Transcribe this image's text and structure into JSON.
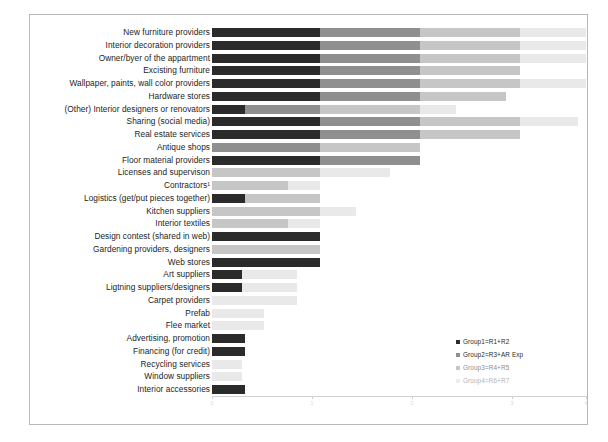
{
  "chart_data": {
    "type": "bar",
    "orientation": "horizontal",
    "stacked": true,
    "title": "",
    "xlabel": "",
    "ylabel": "",
    "grid": false,
    "legend_position": "bottom-right",
    "xlim": [
      0,
      40
    ],
    "xticks": [
      "0",
      "10",
      "20",
      "30",
      "40"
    ],
    "series": [
      {
        "name": "Group1=R1+R2",
        "color": "#2b2b2b",
        "values": [
          16,
          16,
          16,
          16,
          16,
          16,
          5,
          16,
          16,
          0,
          16,
          0,
          0,
          5,
          0,
          0,
          16,
          0,
          16,
          4,
          4,
          0,
          0,
          0,
          5,
          5,
          0,
          0,
          5
        ]
      },
      {
        "name": "Group2=R3+AR Exp",
        "color": "#8f8f8f",
        "values": [
          16,
          16,
          16,
          16,
          16,
          16,
          27,
          16,
          16,
          16,
          16,
          0,
          0,
          11,
          16,
          11,
          0,
          0,
          0,
          0,
          0,
          0,
          0,
          0,
          0,
          0,
          0,
          0,
          0
        ]
      },
      {
        "name": "Group3=R4+R5",
        "color": "#c6c6c6",
        "values": [
          16,
          16,
          16,
          15,
          16,
          11,
          11,
          0,
          0,
          0,
          0,
          16,
          11,
          0,
          0,
          0,
          0,
          16,
          0,
          0,
          0,
          11,
          8,
          8,
          0,
          0,
          5,
          5,
          0
        ]
      },
      {
        "name": "Group4=R6+R7",
        "color": "#e9e9e9",
        "values": [
          13,
          16,
          16,
          0,
          5,
          0,
          0,
          0,
          0,
          0,
          0,
          11,
          5,
          0,
          0,
          5,
          0,
          0,
          0,
          8,
          8,
          0,
          0,
          0,
          0,
          0,
          0,
          0,
          0
        ]
      }
    ],
    "categories": [
      "New furniture providers",
      "Interior decoration providers",
      "Owner/byer of the appartment",
      "Excisting furniture",
      "Wallpaper, paints, wall color providers",
      "Hardware stores",
      "(Other) Interior designers or renovators",
      "Sharing (social media)",
      "Real estate services",
      "Antique shops",
      "Floor material providers",
      "Licenses and supervison",
      "Contractors¹",
      "Logistics (get/put pieces together)",
      "Kitchen suppliers",
      "Interior textiles",
      "Design contest (shared in web)",
      "Gardening providers, designers",
      "Web stores",
      "Art suppliers",
      "Ligtning suppliers/designers",
      "Carpet providers",
      "Prefab",
      "Flee market",
      "Advertising, promotion",
      "Financing (for credit)",
      "Recycling services",
      "Window suppliers",
      "Interior accessories"
    ],
    "rows": [
      {
        "label": "New furniture providers",
        "segments": [
          {
            "w": 108,
            "c": "s0"
          },
          {
            "w": 100,
            "c": "s1"
          },
          {
            "w": 100,
            "c": "s2"
          },
          {
            "w": 66,
            "c": "s3"
          }
        ]
      },
      {
        "label": "Interior decoration providers",
        "segments": [
          {
            "w": 108,
            "c": "s0"
          },
          {
            "w": 100,
            "c": "s1"
          },
          {
            "w": 100,
            "c": "s2"
          },
          {
            "w": 66,
            "c": "s3"
          }
        ]
      },
      {
        "label": "Owner/byer of the appartment",
        "segments": [
          {
            "w": 108,
            "c": "s0"
          },
          {
            "w": 100,
            "c": "s1"
          },
          {
            "w": 100,
            "c": "s2"
          },
          {
            "w": 66,
            "c": "s3"
          }
        ]
      },
      {
        "label": "Excisting furniture",
        "segments": [
          {
            "w": 108,
            "c": "s0"
          },
          {
            "w": 100,
            "c": "s1"
          },
          {
            "w": 100,
            "c": "s2"
          },
          {
            "w": 0,
            "c": "s3"
          }
        ]
      },
      {
        "label": "Wallpaper, paints, wall color providers",
        "segments": [
          {
            "w": 108,
            "c": "s0"
          },
          {
            "w": 100,
            "c": "s1"
          },
          {
            "w": 100,
            "c": "s2"
          },
          {
            "w": 66,
            "c": "s3"
          }
        ]
      },
      {
        "label": "Hardware stores",
        "segments": [
          {
            "w": 108,
            "c": "s0"
          },
          {
            "w": 100,
            "c": "s1"
          },
          {
            "w": 86,
            "c": "s2"
          },
          {
            "w": 0,
            "c": "s3"
          }
        ]
      },
      {
        "label": "(Other) Interior designers or renovators",
        "segments": [
          {
            "w": 33,
            "c": "s0"
          },
          {
            "w": 75,
            "c": "s1"
          },
          {
            "w": 100,
            "c": "s2"
          },
          {
            "w": 36,
            "c": "s3"
          }
        ]
      },
      {
        "label": "Sharing (social media)",
        "segments": [
          {
            "w": 108,
            "c": "s0"
          },
          {
            "w": 100,
            "c": "s1"
          },
          {
            "w": 100,
            "c": "s2"
          },
          {
            "w": 58,
            "c": "s3"
          }
        ]
      },
      {
        "label": "Real estate services",
        "segments": [
          {
            "w": 108,
            "c": "s0"
          },
          {
            "w": 100,
            "c": "s1"
          },
          {
            "w": 100,
            "c": "s2"
          },
          {
            "w": 0,
            "c": "s3"
          }
        ]
      },
      {
        "label": "Antique shops",
        "segments": [
          {
            "w": 0,
            "c": "s0"
          },
          {
            "w": 108,
            "c": "s1"
          },
          {
            "w": 100,
            "c": "s2"
          },
          {
            "w": 0,
            "c": "s3"
          }
        ]
      },
      {
        "label": "Floor material providers",
        "segments": [
          {
            "w": 108,
            "c": "s0"
          },
          {
            "w": 100,
            "c": "s1"
          },
          {
            "w": 0,
            "c": "s2"
          },
          {
            "w": 0,
            "c": "s3"
          }
        ]
      },
      {
        "label": "Licenses and supervison",
        "segments": [
          {
            "w": 0,
            "c": "s0"
          },
          {
            "w": 0,
            "c": "s1"
          },
          {
            "w": 108,
            "c": "s2"
          },
          {
            "w": 70,
            "c": "s3"
          }
        ]
      },
      {
        "label": "Contractors¹",
        "segments": [
          {
            "w": 0,
            "c": "s0"
          },
          {
            "w": 0,
            "c": "s1"
          },
          {
            "w": 76,
            "c": "s2"
          },
          {
            "w": 32,
            "c": "s3"
          }
        ]
      },
      {
        "label": "Logistics (get/put pieces together)",
        "segments": [
          {
            "w": 33,
            "c": "s0"
          },
          {
            "w": 0,
            "c": "s1"
          },
          {
            "w": 75,
            "c": "s2"
          },
          {
            "w": 0,
            "c": "s3"
          }
        ]
      },
      {
        "label": "Kitchen suppliers",
        "segments": [
          {
            "w": 0,
            "c": "s0"
          },
          {
            "w": 0,
            "c": "s1"
          },
          {
            "w": 108,
            "c": "s2"
          },
          {
            "w": 36,
            "c": "s3"
          }
        ]
      },
      {
        "label": "Interior textiles",
        "segments": [
          {
            "w": 0,
            "c": "s0"
          },
          {
            "w": 0,
            "c": "s1"
          },
          {
            "w": 76,
            "c": "s2"
          },
          {
            "w": 32,
            "c": "s3"
          }
        ]
      },
      {
        "label": "Design contest (shared in web)",
        "segments": [
          {
            "w": 108,
            "c": "s0"
          },
          {
            "w": 0,
            "c": "s1"
          },
          {
            "w": 0,
            "c": "s2"
          },
          {
            "w": 0,
            "c": "s3"
          }
        ]
      },
      {
        "label": "Gardening providers, designers",
        "segments": [
          {
            "w": 0,
            "c": "s0"
          },
          {
            "w": 0,
            "c": "s1"
          },
          {
            "w": 108,
            "c": "s2"
          },
          {
            "w": 0,
            "c": "s3"
          }
        ]
      },
      {
        "label": "Web stores",
        "segments": [
          {
            "w": 108,
            "c": "s0"
          },
          {
            "w": 0,
            "c": "s1"
          },
          {
            "w": 0,
            "c": "s2"
          },
          {
            "w": 0,
            "c": "s3"
          }
        ]
      },
      {
        "label": "Art suppliers",
        "segments": [
          {
            "w": 30,
            "c": "s0"
          },
          {
            "w": 0,
            "c": "s1"
          },
          {
            "w": 0,
            "c": "s2"
          },
          {
            "w": 55,
            "c": "s3"
          }
        ]
      },
      {
        "label": "Ligtning suppliers/designers",
        "segments": [
          {
            "w": 30,
            "c": "s0"
          },
          {
            "w": 0,
            "c": "s1"
          },
          {
            "w": 0,
            "c": "s2"
          },
          {
            "w": 55,
            "c": "s3"
          }
        ]
      },
      {
        "label": "Carpet providers",
        "segments": [
          {
            "w": 0,
            "c": "s0"
          },
          {
            "w": 0,
            "c": "s1"
          },
          {
            "w": 0,
            "c": "s2"
          },
          {
            "w": 85,
            "c": "s3"
          }
        ]
      },
      {
        "label": "Prefab",
        "segments": [
          {
            "w": 0,
            "c": "s0"
          },
          {
            "w": 0,
            "c": "s1"
          },
          {
            "w": 0,
            "c": "s2"
          },
          {
            "w": 52,
            "c": "s3"
          }
        ]
      },
      {
        "label": "Flee market",
        "segments": [
          {
            "w": 0,
            "c": "s0"
          },
          {
            "w": 0,
            "c": "s1"
          },
          {
            "w": 0,
            "c": "s2"
          },
          {
            "w": 52,
            "c": "s3"
          }
        ]
      },
      {
        "label": "Advertising, promotion",
        "segments": [
          {
            "w": 33,
            "c": "s0"
          },
          {
            "w": 0,
            "c": "s1"
          },
          {
            "w": 0,
            "c": "s2"
          },
          {
            "w": 0,
            "c": "s3"
          }
        ]
      },
      {
        "label": "Financing (for credit)",
        "segments": [
          {
            "w": 33,
            "c": "s0"
          },
          {
            "w": 0,
            "c": "s1"
          },
          {
            "w": 0,
            "c": "s2"
          },
          {
            "w": 0,
            "c": "s3"
          }
        ]
      },
      {
        "label": "Recycling services",
        "segments": [
          {
            "w": 0,
            "c": "s0"
          },
          {
            "w": 0,
            "c": "s1"
          },
          {
            "w": 0,
            "c": "s2"
          },
          {
            "w": 30,
            "c": "s3"
          }
        ]
      },
      {
        "label": "Window suppliers",
        "segments": [
          {
            "w": 0,
            "c": "s0"
          },
          {
            "w": 0,
            "c": "s1"
          },
          {
            "w": 0,
            "c": "s2"
          },
          {
            "w": 30,
            "c": "s3"
          }
        ]
      },
      {
        "label": "Interior accessories",
        "segments": [
          {
            "w": 33,
            "c": "s0"
          },
          {
            "w": 0,
            "c": "s1"
          },
          {
            "w": 0,
            "c": "s2"
          },
          {
            "w": 0,
            "c": "s3"
          }
        ]
      }
    ]
  },
  "axis": {
    "ticks": [
      {
        "label": "0",
        "x": 0
      },
      {
        "label": "1",
        "x": 100
      },
      {
        "label": "2",
        "x": 200
      },
      {
        "label": "3",
        "x": 300
      },
      {
        "label": "4",
        "x": 374
      }
    ]
  },
  "legend": {
    "items": [
      {
        "label": "Group1=R1+R2",
        "color": "#2b2b2b",
        "tone": ""
      },
      {
        "label": "Group2=R3+AR Exp",
        "color": "#8f8f8f",
        "tone": ""
      },
      {
        "label": "Group3=R4+R5",
        "color": "#c6c6c6",
        "tone": "faint"
      },
      {
        "label": "Group4=R6+R7",
        "color": "#ececec",
        "tone": "faint2"
      }
    ]
  }
}
